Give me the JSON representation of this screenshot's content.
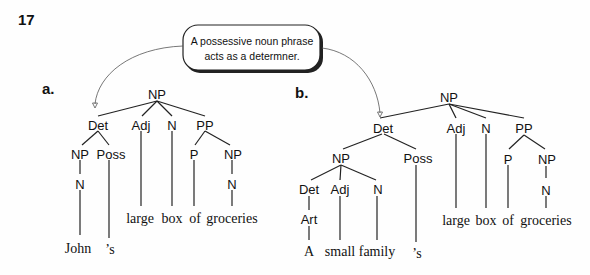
{
  "figure": {
    "number": "17",
    "callout": {
      "line1": "A possessive noun phrase",
      "line2": "acts as a determner."
    },
    "tree_a": {
      "label": "a.",
      "nodes": {
        "root": "NP",
        "det": "Det",
        "adj": "Adj",
        "n": "N",
        "pp": "PP",
        "det_np": "NP",
        "det_poss": "Poss",
        "det_np_n": "N",
        "pp_p": "P",
        "pp_np": "NP",
        "pp_np_n": "N"
      },
      "words": {
        "john": "John",
        "poss": "’s",
        "large": "large",
        "box": "box",
        "of": "of",
        "groceries": "groceries"
      }
    },
    "tree_b": {
      "label": "b.",
      "nodes": {
        "root": "NP",
        "det": "Det",
        "adj": "Adj",
        "n": "N",
        "pp": "PP",
        "det_np": "NP",
        "det_poss": "Poss",
        "inner_det": "Det",
        "inner_adj": "Adj",
        "inner_n": "N",
        "art": "Art",
        "pp_p": "P",
        "pp_np": "NP",
        "pp_np_n": "N"
      },
      "words": {
        "a": "A",
        "small": "small",
        "family": "family",
        "poss": "’s",
        "large": "large",
        "box": "box",
        "of": "of",
        "groceries": "groceries"
      }
    }
  }
}
